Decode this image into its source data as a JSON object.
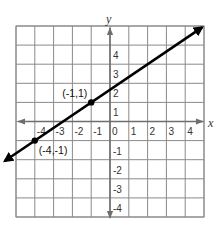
{
  "chart_data": {
    "type": "line",
    "title": "",
    "xlabel": "x",
    "ylabel": "y",
    "xlim": [
      -5,
      5
    ],
    "ylim": [
      -5,
      5
    ],
    "grid": true,
    "x_ticks": [
      -4,
      -3,
      -2,
      -1,
      0,
      1,
      2,
      3,
      4
    ],
    "y_ticks": [
      4,
      3,
      2,
      1,
      -1,
      -2,
      -3,
      -4
    ],
    "series": [
      {
        "name": "line",
        "equation": "y = (2/3)x + 5/3",
        "x": [
          -5.6,
          4.9
        ],
        "y": [
          -2.07,
          4.93
        ],
        "color": "#000000",
        "arrows": "both"
      }
    ],
    "points": [
      {
        "x": -4,
        "y": -1,
        "label": "(-4,-1)"
      },
      {
        "x": -1,
        "y": 1,
        "label": "(-1,1)"
      }
    ]
  }
}
